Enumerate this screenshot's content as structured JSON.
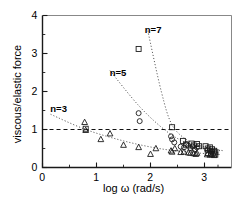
{
  "chart_data": {
    "type": "scatter",
    "title": "",
    "xlabel": "log ω (rad/s)",
    "ylabel": "viscous/elastic force",
    "xlim": [
      0,
      3.5
    ],
    "ylim": [
      0,
      4
    ],
    "xticks": [
      0,
      1,
      2,
      3
    ],
    "xtick_labels": [
      "0",
      "1",
      "2",
      "3"
    ],
    "yticks": [
      0,
      1,
      2,
      3,
      4
    ],
    "ytick_labels": [
      "0",
      "1",
      "2",
      "3",
      "4"
    ],
    "x_minor_ticks": [
      0.5,
      1.5,
      2.5,
      3.25
    ],
    "y_minor_ticks": [
      0.5,
      1.5,
      2.5,
      3.5
    ],
    "grid": false,
    "legend": "inline annotations",
    "annotations": [
      {
        "text": "n=3",
        "x": 0.2,
        "y": 1.55
      },
      {
        "text": "n=5",
        "x": 1.3,
        "y": 2.5
      },
      {
        "text": "n=7",
        "x": 1.95,
        "y": 3.62
      }
    ],
    "reference_lines": [
      {
        "orientation": "horizontal",
        "y": 1.0,
        "style": "dashed"
      }
    ],
    "series": [
      {
        "name": "n=3",
        "marker": "triangle",
        "points": [
          [
            0.78,
            1.19
          ],
          [
            0.8,
            0.98
          ],
          [
            1.08,
            0.74
          ],
          [
            1.25,
            0.89
          ],
          [
            1.5,
            0.59
          ],
          [
            1.78,
            0.53
          ],
          [
            2.0,
            0.35
          ],
          [
            2.1,
            0.5
          ],
          [
            2.38,
            0.44
          ],
          [
            2.4,
            0.41
          ],
          [
            2.45,
            0.5
          ],
          [
            2.56,
            0.4
          ],
          [
            2.62,
            0.41
          ],
          [
            2.7,
            0.39
          ],
          [
            2.74,
            0.38
          ],
          [
            2.8,
            0.37
          ],
          [
            2.84,
            0.35
          ],
          [
            2.86,
            0.38
          ],
          [
            3.05,
            0.34
          ],
          [
            3.1,
            0.33
          ],
          [
            3.14,
            0.34
          ],
          [
            3.18,
            0.32
          ]
        ],
        "fit": [
          [
            0.15,
            1.4
          ],
          [
            0.8,
            1.0
          ],
          [
            1.5,
            0.7
          ],
          [
            2.2,
            0.49
          ],
          [
            2.9,
            0.38
          ],
          [
            3.3,
            0.34
          ]
        ]
      },
      {
        "name": "n=5",
        "marker": "circle",
        "points": [
          [
            1.78,
            1.43
          ],
          [
            1.8,
            1.22
          ],
          [
            2.38,
            0.82
          ],
          [
            2.4,
            0.74
          ],
          [
            2.44,
            0.66
          ],
          [
            2.56,
            0.55
          ],
          [
            2.62,
            0.53
          ],
          [
            2.66,
            0.62
          ],
          [
            2.7,
            0.57
          ],
          [
            2.74,
            0.51
          ],
          [
            2.78,
            0.55
          ],
          [
            2.82,
            0.47
          ],
          [
            2.86,
            0.53
          ],
          [
            3.05,
            0.46
          ],
          [
            3.1,
            0.44
          ],
          [
            3.14,
            0.42
          ]
        ],
        "fit": [
          [
            1.25,
            2.55
          ],
          [
            1.8,
            1.6
          ],
          [
            2.3,
            0.95
          ],
          [
            2.7,
            0.63
          ],
          [
            3.1,
            0.48
          ],
          [
            3.3,
            0.44
          ]
        ]
      },
      {
        "name": "n=7",
        "marker": "square",
        "points": [
          [
            1.78,
            3.12
          ],
          [
            2.4,
            1.06
          ],
          [
            2.6,
            0.7
          ],
          [
            2.66,
            0.6
          ],
          [
            2.76,
            0.63
          ],
          [
            2.8,
            0.58
          ],
          [
            2.86,
            0.62
          ],
          [
            2.9,
            0.56
          ],
          [
            3.02,
            0.56
          ],
          [
            3.06,
            0.5
          ],
          [
            3.1,
            0.53
          ],
          [
            3.14,
            0.48
          ],
          [
            3.18,
            0.44
          ],
          [
            3.2,
            0.4
          ],
          [
            3.06,
            0.38
          ],
          [
            3.12,
            0.36
          ],
          [
            3.17,
            0.37
          ],
          [
            3.2,
            0.34
          ],
          [
            0.8,
            1.02
          ]
        ],
        "fit": [
          [
            1.95,
            3.6
          ],
          [
            2.2,
            2.0
          ],
          [
            2.4,
            1.12
          ],
          [
            2.7,
            0.7
          ],
          [
            3.0,
            0.54
          ],
          [
            3.35,
            0.44
          ]
        ]
      }
    ]
  }
}
